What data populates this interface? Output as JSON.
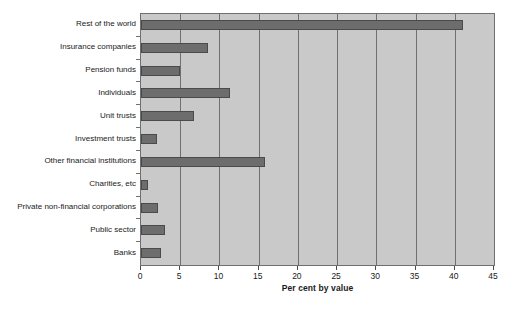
{
  "chart_data": {
    "type": "bar",
    "orientation": "horizontal",
    "title": "",
    "xlabel": "Per cent by value",
    "ylabel": "",
    "xlim": [
      0,
      45
    ],
    "xticks": [
      0,
      5,
      10,
      15,
      20,
      25,
      30,
      35,
      40,
      45
    ],
    "grid": "vertical",
    "legend": "none",
    "categories": [
      "Rest of the world",
      "Insurance companies",
      "Pension funds",
      "Individuals",
      "Unit trusts",
      "Investment trusts",
      "Other financial institutions",
      "Charities, etc",
      "Private non-financial corporations",
      "Public sector",
      "Banks"
    ],
    "values": [
      41.0,
      8.5,
      5.0,
      11.3,
      6.8,
      2.0,
      15.8,
      0.9,
      2.2,
      3.1,
      2.6
    ],
    "colors": {
      "bar_fill": "#6d6d6d",
      "bar_edge": "#4a4a4a",
      "plot_background": "#c9c9c9",
      "gridline": "#6f6f6f",
      "figure_background": "#ffffff",
      "text": "#1a1a1a"
    }
  },
  "caption": {
    "text": ""
  }
}
